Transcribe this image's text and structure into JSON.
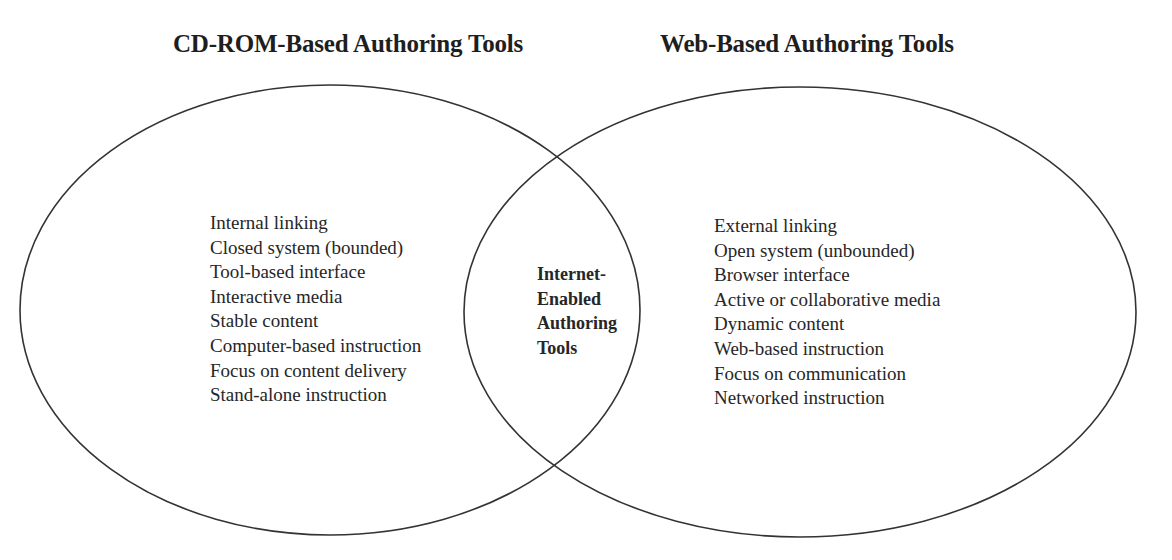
{
  "diagram": {
    "type": "venn",
    "stroke_color": "#333333",
    "sets": [
      {
        "id": "cdrom",
        "title": "CD-ROM-Based Authoring Tools",
        "items": [
          "Internal linking",
          "Closed system (bounded)",
          "Tool-based interface",
          "Interactive media",
          "Stable content",
          "Computer-based instruction",
          "Focus on content delivery",
          "Stand-alone instruction"
        ]
      },
      {
        "id": "web",
        "title": "Web-Based Authoring Tools",
        "items": [
          "External linking",
          "Open system (unbounded)",
          "Browser interface",
          "Active or collaborative media",
          "Dynamic content",
          "Web-based instruction",
          "Focus on communication",
          "Networked instruction"
        ]
      }
    ],
    "intersection": {
      "label_lines": [
        "Internet-",
        "Enabled",
        "Authoring",
        "Tools"
      ]
    }
  }
}
